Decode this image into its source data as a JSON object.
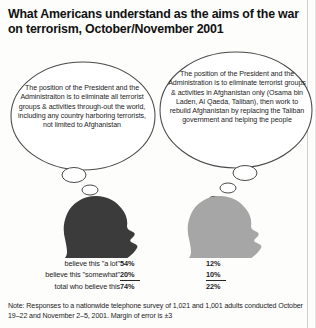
{
  "title": "What Americans understand as the aims of the war on terrorism, October/November 2001",
  "bubbles": {
    "left": {
      "text": "The position of the President and the Administraiton is to eliminate all terrorist groups & activities through-out the world, including any country harboring terrorists, not limited to Afghanistan"
    },
    "right": {
      "text": "The position of the President and the Administration is to eliminate terrorist groups & activities in Afghanistan only (Osama bin Laden, Al Qaeda, Taliban), then work to rebuild Afghanistan by replacing the Taliban government and helping the people"
    }
  },
  "figures": {
    "left_silhouette": "head-silhouette-dark",
    "right_silhouette": "head-silhouette-gray",
    "left_color": "#3b3b3b",
    "right_color": "#a6a6a6"
  },
  "stats": {
    "rows": [
      {
        "label": "believe this \"a lot\"",
        "left": "54%",
        "right": "12%",
        "total": false
      },
      {
        "label": "believe this \"somewhat\"",
        "left": "20%",
        "right": "10%",
        "total": false
      },
      {
        "label": "total who believe this",
        "left": "74%",
        "right": "22%",
        "total": true
      }
    ]
  },
  "note": "Note: Responses to a nationwide telephone survey of 1,021 and 1,001 adults conducted October 19–22 and November 2–5, 2001. Margin of error is ±3"
}
